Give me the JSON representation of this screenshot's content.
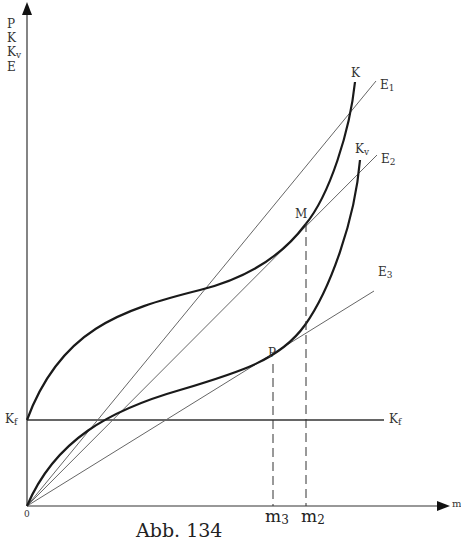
{
  "figure": {
    "caption": "Abb. 134",
    "y_axis_labels": [
      "P",
      "K",
      "K",
      "E"
    ],
    "y_axis_label_kv_sub": "v",
    "x_axis_label": "m",
    "origin_label": "0",
    "kf_left_label": "K",
    "kf_right_label": "K",
    "kf_sub": "f",
    "curve_labels": {
      "K": "K",
      "Kv_main": "K",
      "Kv_sub": "v",
      "E1_main": "E",
      "E1_sub": "1",
      "E2_main": "E",
      "E2_sub": "2",
      "E3_main": "E",
      "E3_sub": "3"
    },
    "point_labels": {
      "M": "M",
      "P": "P"
    },
    "x_tick_labels": {
      "m3_main": "m",
      "m3_sub": "3",
      "m2_main": "m",
      "m2_sub": "2"
    },
    "colors": {
      "curve": "#1a1a1a",
      "line": "#555555",
      "axis": "#333333"
    }
  }
}
